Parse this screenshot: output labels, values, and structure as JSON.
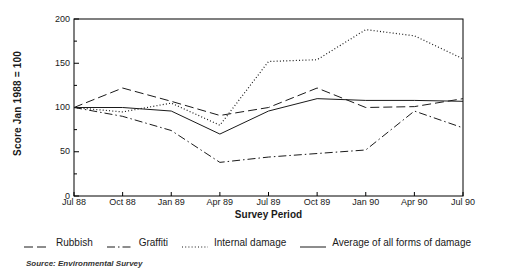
{
  "chart_data": {
    "type": "line",
    "title": "",
    "xlabel": "Survey Period",
    "ylabel": "Score Jan 1988 = 100",
    "categories": [
      "Jul 88",
      "Oct 88",
      "Jan 89",
      "Apr 89",
      "Jul 89",
      "Oct 89",
      "Jan 90",
      "Apr 90",
      "Jul 90"
    ],
    "ylim": [
      0,
      200
    ],
    "yticks": [
      0,
      50,
      100,
      150,
      200
    ],
    "yticks_minor": [
      25,
      75,
      125,
      175
    ],
    "grid": false,
    "legend_position": "below",
    "series": [
      {
        "name": "Rubbish",
        "style": "dashed",
        "values": [
          100,
          122,
          107,
          91,
          100,
          122,
          100,
          101,
          110
        ]
      },
      {
        "name": "Graffiti",
        "style": "dash-dot",
        "values": [
          100,
          90,
          74,
          38,
          44,
          48,
          52,
          96,
          77
        ]
      },
      {
        "name": "Internal damage",
        "style": "dotted",
        "values": [
          100,
          95,
          105,
          80,
          152,
          154,
          188,
          181,
          155
        ]
      },
      {
        "name": "Average of all forms of damage",
        "style": "solid",
        "values": [
          100,
          100,
          96,
          70,
          96,
          110,
          108,
          108,
          107
        ]
      }
    ]
  },
  "legend": {
    "items": [
      {
        "label": "Rubbish",
        "style": "dashed"
      },
      {
        "label": "Graffiti",
        "style": "dash-dot"
      },
      {
        "label": "Internal damage",
        "style": "dotted"
      },
      {
        "label": "Average of all forms of damage",
        "style": "solid"
      }
    ]
  },
  "source": {
    "text": "Source: Environmental Survey"
  },
  "colors": {
    "line": "#1a1a1a",
    "axis": "#000000",
    "background": "#ffffff"
  }
}
